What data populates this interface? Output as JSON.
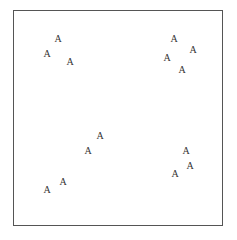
{
  "frame": {
    "border_color": "#555555"
  },
  "glyphs": [
    {
      "label": "A",
      "x": 58,
      "y": 39
    },
    {
      "label": "A",
      "x": 47,
      "y": 54
    },
    {
      "label": "A",
      "x": 70,
      "y": 62
    },
    {
      "label": "A",
      "x": 174,
      "y": 39
    },
    {
      "label": "A",
      "x": 193,
      "y": 50
    },
    {
      "label": "A",
      "x": 167,
      "y": 58
    },
    {
      "label": "A",
      "x": 182,
      "y": 70
    },
    {
      "label": "A",
      "x": 100,
      "y": 136
    },
    {
      "label": "A",
      "x": 88,
      "y": 151
    },
    {
      "label": "A",
      "x": 63,
      "y": 182
    },
    {
      "label": "A",
      "x": 47,
      "y": 190
    },
    {
      "label": "A",
      "x": 186,
      "y": 151
    },
    {
      "label": "A",
      "x": 190,
      "y": 166
    },
    {
      "label": "A",
      "x": 175,
      "y": 174
    }
  ]
}
